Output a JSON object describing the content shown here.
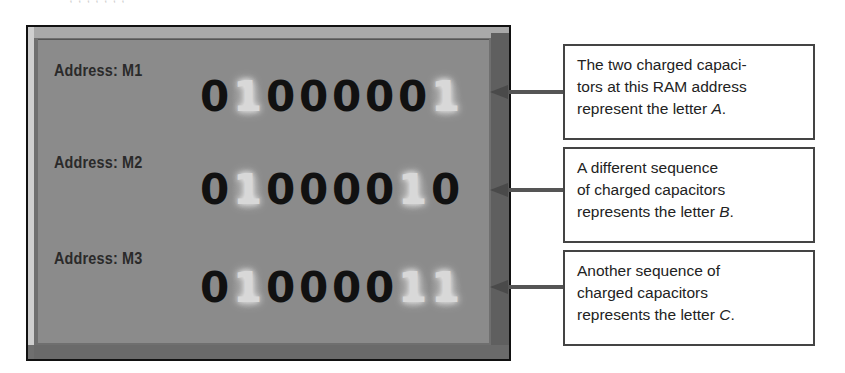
{
  "clipped_caption": "· , , ,  ,    ,     ,   ,",
  "memory_panel": {
    "colors": {
      "panel_fill": "#8b8b8b",
      "border": "#111111",
      "bit_off": "#111111",
      "bit_on": "#d8d8d8"
    },
    "rows": [
      {
        "address_label": "Address: M1",
        "bits": [
          "0",
          "1",
          "0",
          "0",
          "0",
          "0",
          "0",
          "1"
        ],
        "letter": "A"
      },
      {
        "address_label": "Address: M2",
        "bits": [
          "0",
          "1",
          "0",
          "0",
          "0",
          "0",
          "1",
          "0"
        ],
        "letter": "B"
      },
      {
        "address_label": "Address: M3",
        "bits": [
          "0",
          "1",
          "0",
          "0",
          "0",
          "0",
          "1",
          "1"
        ],
        "letter": "C"
      }
    ]
  },
  "callouts": [
    {
      "lines": [
        "The two charged capaci-",
        "tors at this RAM address",
        "represent the letter "
      ],
      "letter": "A",
      "suffix": "."
    },
    {
      "lines": [
        "A different sequence",
        "of charged capacitors",
        "represents the letter "
      ],
      "letter": "B",
      "suffix": "."
    },
    {
      "lines": [
        "Another sequence of",
        "charged capacitors",
        "represents the letter "
      ],
      "letter": "C",
      "suffix": "."
    }
  ]
}
